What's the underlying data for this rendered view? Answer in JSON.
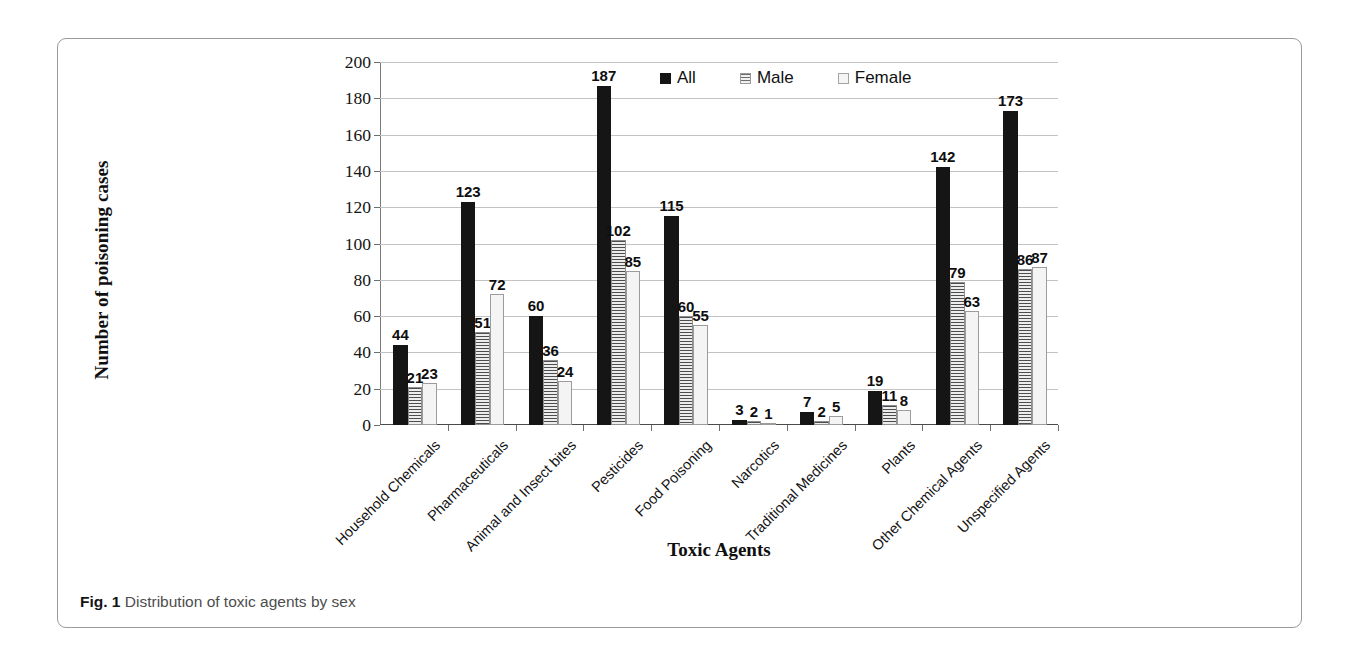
{
  "figure": {
    "caption_label": "Fig. 1",
    "caption_text": "Distribution of toxic agents by sex"
  },
  "chart_data": {
    "type": "bar",
    "title": "",
    "xlabel": "Toxic Agents",
    "ylabel": "Number of poisoning cases",
    "ylim": [
      0,
      200
    ],
    "ytick_step": 20,
    "yticks": [
      0,
      20,
      40,
      60,
      80,
      100,
      120,
      140,
      160,
      180,
      200
    ],
    "grid": true,
    "legend_position": "top-center",
    "categories": [
      "Household Chemicals",
      "Pharmaceuticals",
      "Animal and Insect bites",
      "Pesticides",
      "Food Poisoning",
      "Narcotics",
      "Traditional Medicines",
      "Plants",
      "Other Chemical Agents",
      "Unspecified Agents"
    ],
    "series": [
      {
        "name": "All",
        "color": "#151515",
        "pattern": "solid",
        "values": [
          44,
          123,
          60,
          187,
          115,
          3,
          7,
          19,
          142,
          173
        ]
      },
      {
        "name": "Male",
        "color": "#ededed",
        "pattern": "horizontal-hatch",
        "values": [
          21,
          51,
          36,
          102,
          60,
          2,
          2,
          11,
          79,
          86
        ]
      },
      {
        "name": "Female",
        "color": "#f4f4f4",
        "pattern": "plain-light",
        "values": [
          23,
          72,
          24,
          85,
          55,
          1,
          5,
          8,
          63,
          87
        ]
      }
    ]
  }
}
